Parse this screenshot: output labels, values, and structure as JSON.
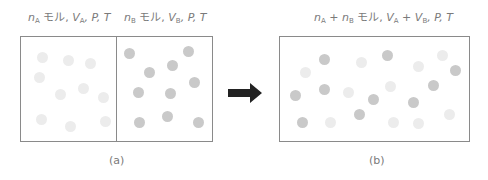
{
  "colors": {
    "gas_a": "#ececec",
    "gas_b": "#c9c9c9",
    "outline": "#8a8a8a",
    "arrow": "#222222",
    "text": "#7a7a7a"
  },
  "panel_a": {
    "caption": "(a)",
    "left_label": {
      "n": "n",
      "n_sub": "A",
      "unit": " モル, ",
      "v": "V",
      "v_sub": "A",
      "rest": ", P, T"
    },
    "right_label": {
      "n": "n",
      "n_sub": "B",
      "unit": " モル, ",
      "v": "V",
      "v_sub": "B",
      "rest": ", P, T"
    },
    "gas_a_particles": [
      [
        42,
        57
      ],
      [
        68,
        60
      ],
      [
        90,
        63
      ],
      [
        39,
        77
      ],
      [
        60,
        94
      ],
      [
        83,
        88
      ],
      [
        103,
        97
      ],
      [
        41,
        119
      ],
      [
        70,
        126
      ],
      [
        105,
        121
      ]
    ],
    "gas_b_particles": [
      [
        129,
        53
      ],
      [
        188,
        51
      ],
      [
        149,
        72
      ],
      [
        172,
        65
      ],
      [
        194,
        82
      ],
      [
        138,
        92
      ],
      [
        170,
        93
      ],
      [
        139,
        122
      ],
      [
        167,
        116
      ],
      [
        198,
        122
      ]
    ]
  },
  "arrow": {
    "icon": "right-arrow-icon"
  },
  "panel_b": {
    "caption": "(b)",
    "label": {
      "n1": "n",
      "n1_sub": "A",
      "plus1": " + ",
      "n2": "n",
      "n2_sub": "B",
      "unit": " モル, ",
      "v1": "V",
      "v1_sub": "A",
      "plus2": " + ",
      "v2": "V",
      "v2_sub": "B",
      "rest": ", P, T"
    },
    "gas_a_particles": [
      [
        361,
        62
      ],
      [
        305,
        72
      ],
      [
        348,
        92
      ],
      [
        330,
        122
      ],
      [
        442,
        55
      ],
      [
        418,
        66
      ],
      [
        390,
        86
      ],
      [
        449,
        114
      ],
      [
        393,
        122
      ],
      [
        418,
        123
      ]
    ],
    "gas_b_particles": [
      [
        324,
        59
      ],
      [
        295,
        95
      ],
      [
        324,
        89
      ],
      [
        373,
        99
      ],
      [
        359,
        114
      ],
      [
        302,
        122
      ],
      [
        387,
        55
      ],
      [
        455,
        70
      ],
      [
        433,
        85
      ],
      [
        413,
        102
      ]
    ]
  }
}
